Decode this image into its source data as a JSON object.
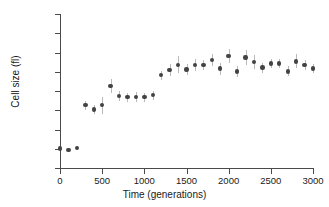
{
  "chart_data": {
    "type": "scatter",
    "title": "",
    "xlabel": "Time (generations)",
    "ylabel": "Cell size (fl)",
    "xlim": [
      0,
      3000
    ],
    "ylim": [
      0.3,
      0.7
    ],
    "xticks": [
      0,
      500,
      1000,
      1500,
      2000,
      2500,
      3000
    ],
    "xtick_labels": [
      "0",
      "500",
      "1000",
      "1500",
      "2000",
      "2500",
      "3000"
    ],
    "yticks": [
      0.3,
      0.35,
      0.4,
      0.45,
      0.5,
      0.55,
      0.6,
      0.65,
      0.7
    ],
    "ytick_labels": [
      "0.30",
      "0.35",
      "0.40",
      "0.45",
      "0.50",
      "0.55",
      "0.60",
      "0.65",
      "0.70"
    ],
    "grid": false,
    "legend": false,
    "marker_color": "#434343",
    "errorbar_color": "#b9b9b9",
    "series": [
      {
        "name": "Cell size",
        "x": [
          0,
          100,
          200,
          300,
          400,
          500,
          600,
          700,
          800,
          900,
          1000,
          1100,
          1200,
          1300,
          1400,
          1500,
          1600,
          1700,
          1800,
          1900,
          2000,
          2100,
          2200,
          2300,
          2400,
          2500,
          2600,
          2700,
          2800,
          2900,
          3000
        ],
        "y": [
          0.351,
          0.347,
          0.352,
          0.463,
          0.452,
          0.463,
          0.513,
          0.487,
          0.484,
          0.484,
          0.484,
          0.489,
          0.541,
          0.555,
          0.568,
          0.556,
          0.568,
          0.568,
          0.581,
          0.558,
          0.591,
          0.551,
          0.587,
          0.575,
          0.561,
          0.571,
          0.571,
          0.551,
          0.577,
          0.567,
          0.558
        ],
        "yerr": [
          0.003,
          0.006,
          0.004,
          0.012,
          0.012,
          0.022,
          0.018,
          0.013,
          0.012,
          0.013,
          0.012,
          0.012,
          0.012,
          0.016,
          0.022,
          0.014,
          0.015,
          0.013,
          0.016,
          0.016,
          0.018,
          0.014,
          0.02,
          0.019,
          0.013,
          0.012,
          0.012,
          0.013,
          0.018,
          0.013,
          0.012
        ]
      }
    ]
  },
  "figure": {
    "alt_name": "cell-size-vs-generations-scatter"
  }
}
